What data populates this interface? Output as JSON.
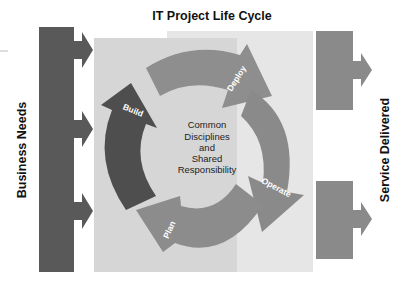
{
  "title": "IT Project Life Cycle",
  "left_label": "Business Needs",
  "right_label": "Service Delivered",
  "center": {
    "lines": [
      "Common",
      "Disciplines",
      "and",
      "Shared",
      "Responsibility"
    ]
  },
  "phases": [
    {
      "label": "Deploy",
      "color": "#8e8e8e"
    },
    {
      "label": "Operate",
      "color": "#8a8a8a"
    },
    {
      "label": "Plan",
      "color": "#8c8c8c"
    },
    {
      "label": "Build",
      "color": "#4e4e4e"
    }
  ],
  "colors": {
    "input_bar": "#595959",
    "output_box": "#8a8a8a",
    "panel_left": "#d6d6d6",
    "panel_right": "#e6e6e6"
  }
}
